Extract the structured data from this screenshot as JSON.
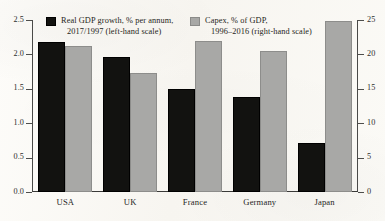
{
  "chart_data": {
    "type": "bar",
    "title": "",
    "subtitle": "",
    "xlabel": "",
    "categories": [
      "USA",
      "UK",
      "France",
      "Germany",
      "Japan"
    ],
    "grid": false,
    "legend_position": "top-inside",
    "series": [
      {
        "name": "Real GDP growth, % per annum, 2017/1997 (left-hand scale)",
        "axis": "left",
        "color": "#121210",
        "values": [
          2.18,
          1.97,
          1.5,
          1.38,
          0.72
        ]
      },
      {
        "name": "Capex, % of GDP, 1996–2016 (right-hand scale)",
        "axis": "right",
        "color": "#a8a8a6",
        "values": [
          21.3,
          17.3,
          22.0,
          20.5,
          24.8
        ]
      }
    ],
    "left_axis": {
      "label": "Real GDP growth, % per annum",
      "ylim": [
        0.0,
        2.5
      ],
      "ticks": [
        0.0,
        0.5,
        1.0,
        1.5,
        2.0,
        2.5
      ],
      "ticklabels": [
        "0.0",
        "0.5",
        "1.0",
        "1.5",
        "2.0",
        "2.5"
      ]
    },
    "right_axis": {
      "label": "Capex, % of GDP",
      "ylim": [
        0,
        25
      ],
      "ticks": [
        0,
        5,
        10,
        15,
        20,
        25
      ],
      "ticklabels": [
        "0",
        "5",
        "10",
        "15",
        "20",
        "25"
      ]
    }
  },
  "legend": {
    "entries": [
      {
        "line1": "Real GDP growth, % per annum,",
        "line2": "2017/1997 (left-hand scale)",
        "swatch": "black-square-swatch"
      },
      {
        "line1": "Capex, % of GDP,",
        "line2": "1996–2016 (right-hand scale)",
        "swatch": "grey-square-swatch"
      }
    ]
  },
  "colors": {
    "gdp_bar": "#121210",
    "capex_bar": "#a8a8a6",
    "axis": "#3a3a38",
    "text": "#1f1f1a",
    "paper": "#fbfaf7"
  }
}
